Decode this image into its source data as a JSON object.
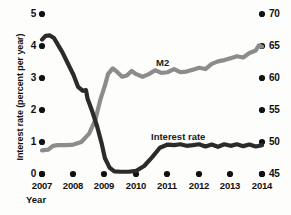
{
  "chart_data": {
    "type": "line",
    "title": "",
    "xlabel": "Year",
    "ylabel": "Interest rate (percent per year)",
    "y2label": "",
    "xlim": [
      2007,
      2014
    ],
    "ylim": [
      0,
      5
    ],
    "y2lim": [
      45,
      70
    ],
    "grid": false,
    "legend_position": "inline-annotation",
    "x_tick_labels": [
      "2007",
      "2008",
      "2009",
      "2010",
      "2011",
      "2012",
      "2013",
      "2014"
    ],
    "x_ticks": [
      2007,
      2008,
      2009,
      2010,
      2011,
      2012,
      2013,
      2014
    ],
    "y_tick_labels": [
      "0",
      "1",
      "2",
      "3",
      "4",
      "5"
    ],
    "y_ticks": [
      0,
      1,
      2,
      3,
      4,
      5
    ],
    "y2_tick_labels": [
      "45",
      "50",
      "55",
      "60",
      "65",
      "70"
    ],
    "y2_ticks": [
      45,
      50,
      55,
      60,
      65,
      70
    ],
    "series": [
      {
        "name": "Interest rate",
        "axis": "left",
        "color": "#2b2b2b",
        "label_text": "Interest rate",
        "x": [
          2007.0,
          2007.12,
          2007.25,
          2007.38,
          2007.5,
          2007.65,
          2007.8,
          2008.0,
          2008.15,
          2008.3,
          2008.4,
          2008.45,
          2008.6,
          2008.75,
          2008.9,
          2009.0,
          2009.15,
          2009.3,
          2009.5,
          2009.75,
          2010.0,
          2010.25,
          2010.5,
          2010.75,
          2011.0,
          2011.2,
          2011.4,
          2011.6,
          2011.8,
          2012.0,
          2012.2,
          2012.4,
          2012.6,
          2012.8,
          2013.0,
          2013.2,
          2013.4,
          2013.6,
          2013.8,
          2014.0
        ],
        "y": [
          4.2,
          4.32,
          4.33,
          4.25,
          4.05,
          3.8,
          3.5,
          3.1,
          2.72,
          2.6,
          2.62,
          2.35,
          1.95,
          1.5,
          0.95,
          0.5,
          0.2,
          0.08,
          0.07,
          0.07,
          0.1,
          0.25,
          0.52,
          0.82,
          0.92,
          0.9,
          0.93,
          0.88,
          0.9,
          0.93,
          0.86,
          0.92,
          0.85,
          0.93,
          0.88,
          0.93,
          0.87,
          0.92,
          0.86,
          0.9
        ]
      },
      {
        "name": "M2",
        "axis": "right",
        "color": "#8c8c8c",
        "label_text": "M2",
        "x": [
          2007.0,
          2007.2,
          2007.35,
          2007.5,
          2007.75,
          2008.0,
          2008.25,
          2008.5,
          2008.7,
          2008.85,
          2009.0,
          2009.1,
          2009.25,
          2009.4,
          2009.55,
          2009.7,
          2009.85,
          2010.0,
          2010.2,
          2010.4,
          2010.6,
          2010.8,
          2011.0,
          2011.2,
          2011.4,
          2011.6,
          2011.8,
          2012.0,
          2012.2,
          2012.4,
          2012.6,
          2012.8,
          2013.0,
          2013.2,
          2013.4,
          2013.6,
          2013.8,
          2013.9,
          2014.0
        ],
        "y": [
          48.7,
          48.8,
          49.4,
          49.5,
          49.5,
          49.6,
          50.0,
          51.3,
          53.5,
          56.5,
          58.8,
          60.6,
          61.5,
          60.9,
          60.2,
          60.4,
          61.1,
          60.6,
          60.2,
          60.6,
          61.2,
          60.8,
          60.9,
          61.4,
          60.9,
          61.0,
          61.3,
          61.6,
          61.4,
          62.2,
          62.6,
          62.8,
          63.1,
          63.4,
          63.2,
          63.9,
          64.3,
          65.1,
          64.9
        ]
      }
    ]
  },
  "axis_titles": {
    "y_left": "Interest rate (percent per year)",
    "x": "Year"
  },
  "annotations": {
    "m2": "M2",
    "interest_rate": "Interest rate"
  },
  "colors": {
    "interest_rate_line": "#2b2b2b",
    "m2_line": "#8c8c8c",
    "tick_marker": "#111111",
    "background": "#fdfdfc"
  }
}
